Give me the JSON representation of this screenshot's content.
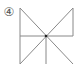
{
  "figure": {
    "label": "④",
    "stroke_color": "#888888",
    "center_dot_color": "#222222"
  }
}
